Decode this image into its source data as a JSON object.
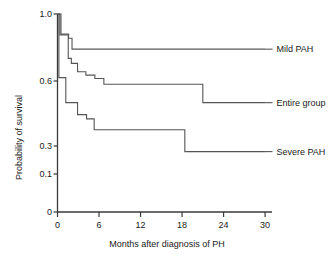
{
  "chart_data": {
    "type": "line",
    "subtype": "kaplan-meier-step",
    "title": "",
    "xlabel": "Months after diagnosis of PH",
    "ylabel": "Probability of survival",
    "xlim": [
      0,
      31
    ],
    "ylim": [
      0,
      1.0
    ],
    "xticks": [
      0,
      6,
      12,
      18,
      24,
      30
    ],
    "xtick_labels": [
      "0",
      "6",
      "12",
      "18",
      "24",
      "30"
    ],
    "yticks": [
      0,
      0.1,
      0.3,
      0.6,
      1.0
    ],
    "ytick_labels": [
      "0",
      "0.1",
      "0.3",
      "0.6",
      "1.0"
    ],
    "grid": false,
    "legend_position": "right-inline-annotations",
    "line_color": "#555555",
    "axis_color": "#3a3a3a",
    "background": "#ffffff",
    "series": [
      {
        "name": "Mild PAH",
        "label": "Mild PAH",
        "color": "#555555",
        "label_x_month": 31.5,
        "label_y_value": 0.79,
        "steps": [
          {
            "x": 0.0,
            "y": 1.0
          },
          {
            "x": 0.5,
            "y": 1.0
          },
          {
            "x": 0.5,
            "y": 0.88
          },
          {
            "x": 1.6,
            "y": 0.88
          },
          {
            "x": 1.6,
            "y": 0.855
          },
          {
            "x": 2.1,
            "y": 0.855
          },
          {
            "x": 2.1,
            "y": 0.79
          },
          {
            "x": 30.0,
            "y": 0.79
          }
        ]
      },
      {
        "name": "Entire group",
        "label": "Entire group",
        "color": "#555555",
        "label_x_month": 31.5,
        "label_y_value": 0.5,
        "steps": [
          {
            "x": 0.0,
            "y": 1.0
          },
          {
            "x": 0.35,
            "y": 1.0
          },
          {
            "x": 0.35,
            "y": 0.875
          },
          {
            "x": 1.55,
            "y": 0.875
          },
          {
            "x": 1.55,
            "y": 0.735
          },
          {
            "x": 2.0,
            "y": 0.735
          },
          {
            "x": 2.0,
            "y": 0.705
          },
          {
            "x": 2.9,
            "y": 0.705
          },
          {
            "x": 2.9,
            "y": 0.655
          },
          {
            "x": 4.1,
            "y": 0.655
          },
          {
            "x": 4.1,
            "y": 0.635
          },
          {
            "x": 5.4,
            "y": 0.635
          },
          {
            "x": 5.4,
            "y": 0.615
          },
          {
            "x": 6.7,
            "y": 0.615
          },
          {
            "x": 6.7,
            "y": 0.585
          },
          {
            "x": 21.0,
            "y": 0.585
          },
          {
            "x": 21.0,
            "y": 0.5
          },
          {
            "x": 30.0,
            "y": 0.5
          }
        ]
      },
      {
        "name": "Severe PAH",
        "label": "Severe PAH",
        "color": "#555555",
        "label_x_month": 31.5,
        "label_y_value": 0.26,
        "steps": [
          {
            "x": 0.0,
            "y": 1.0
          },
          {
            "x": 0.2,
            "y": 1.0
          },
          {
            "x": 0.2,
            "y": 0.62
          },
          {
            "x": 1.2,
            "y": 0.62
          },
          {
            "x": 1.2,
            "y": 0.5
          },
          {
            "x": 2.9,
            "y": 0.5
          },
          {
            "x": 2.9,
            "y": 0.445
          },
          {
            "x": 4.2,
            "y": 0.445
          },
          {
            "x": 4.2,
            "y": 0.425
          },
          {
            "x": 5.3,
            "y": 0.425
          },
          {
            "x": 5.3,
            "y": 0.375
          },
          {
            "x": 18.4,
            "y": 0.375
          },
          {
            "x": 18.4,
            "y": 0.26
          },
          {
            "x": 30.0,
            "y": 0.26
          }
        ]
      }
    ]
  },
  "axes": {
    "x_title": "Months after diagnosis of PH",
    "y_title": "Probability of survival"
  }
}
